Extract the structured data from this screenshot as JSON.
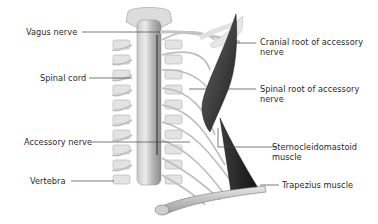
{
  "figure": {
    "labels": {
      "vagus_nerve": "Vagus nerve",
      "spinal_cord": "Spinal cord",
      "accessory_nerve": "Accessory nerve",
      "vertebra": "Vertebra",
      "cranial_root_line1": "Cranial root of accessory",
      "cranial_root_line2": "nerve",
      "spinal_root_line1": "Spinal root of accessory",
      "spinal_root_line2": "nerve",
      "scm_line1": "Sternocleidomastoid",
      "scm_line2": "muscle",
      "trapezius": "Trapezius muscle"
    },
    "colors": {
      "background": "#ffffff",
      "text": "#2a2a2a",
      "leader_line": "#444444",
      "bone": "#d9d9d9",
      "bone_shadow": "#a8a8a8",
      "nerve": "#b8b8b8",
      "muscle_dark": "#2b2b2b",
      "muscle_mid": "#5a5a5a"
    }
  }
}
